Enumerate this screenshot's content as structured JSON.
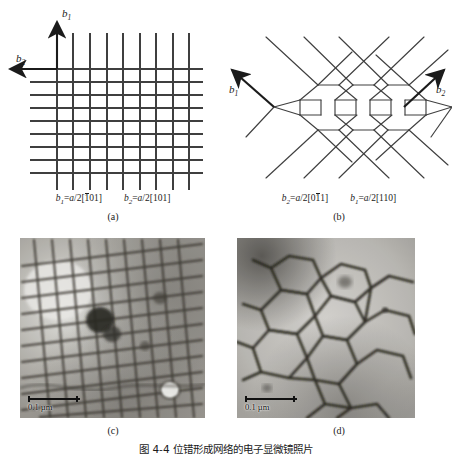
{
  "figure": {
    "caption": "图 4-4  位错形成网络的电子显微镜照片",
    "panels": [
      {
        "id": "a",
        "label": "(a)",
        "type": "square-dislocation-network-schematic",
        "burgers_vectors": [
          {
            "symbol": "b",
            "subscript": "1",
            "value": "a/2[101]",
            "overbar_index": 0,
            "digits": [
              "1",
              "0",
              "1"
            ]
          },
          {
            "symbol": "b",
            "subscript": "2",
            "value": "a/2[101]",
            "overbar_index": -1,
            "digits": [
              "1",
              "0",
              "1"
            ]
          }
        ],
        "arrows": [
          {
            "name": "b1",
            "label_sub": "1",
            "direction": "up"
          },
          {
            "name": "b2",
            "label_sub": "2",
            "direction": "left"
          }
        ],
        "grid": {
          "vertical_lines": 10,
          "horizontal_lines": 11
        }
      },
      {
        "id": "b",
        "label": "(b)",
        "type": "hexagonal-dislocation-network-schematic",
        "burgers_vectors": [
          {
            "symbol": "b",
            "subscript": "2",
            "value": "a/2[011]",
            "overbar_index": 1,
            "digits": [
              "0",
              "1",
              "1"
            ]
          },
          {
            "symbol": "b",
            "subscript": "1",
            "value": "a/2[110]",
            "overbar_index": -1,
            "digits": [
              "1",
              "1",
              "0"
            ]
          }
        ],
        "arrows": [
          {
            "name": "b1",
            "label_sub": "1",
            "direction": "up-left"
          },
          {
            "name": "b2",
            "label_sub": "2",
            "direction": "up-right"
          }
        ]
      },
      {
        "id": "c",
        "label": "(c)",
        "type": "tem-micrograph",
        "network": "square",
        "scale_bar": "0.1 µm"
      },
      {
        "id": "d",
        "label": "(d)",
        "type": "tem-micrograph",
        "network": "hexagonal",
        "scale_bar": "0.1 µm"
      }
    ]
  },
  "colors": {
    "ink": "#1b1b1b",
    "line": "#3a3a3a",
    "background": "#ffffff",
    "micrograph_mid": "#9a9a9a",
    "micrograph_dark": "#2e2e2e",
    "micrograph_light": "#e8e8e8"
  }
}
